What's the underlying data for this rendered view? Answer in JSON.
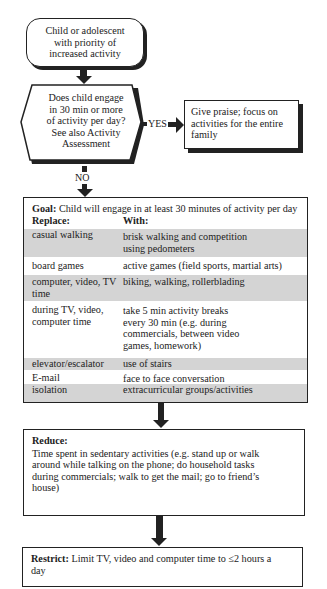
{
  "start": {
    "text": "Child or adolescent with priority of increased activity",
    "lines": [
      "Child or adolescent",
      "with priority of",
      "increased activity"
    ]
  },
  "decision": {
    "lines": [
      "Does child engage",
      "in 30 min or more",
      "of activity per day?",
      "See also Activity",
      "Assessment"
    ]
  },
  "yes_label": "YES",
  "no_label": "NO",
  "praise": {
    "text": "Give praise; focus on activities for the entire family"
  },
  "goal": {
    "label": "Goal:",
    "text": "Child will engage in at least 30 minutes of activity per day",
    "col_replace": "Replace:",
    "col_with": "With:",
    "rows": [
      {
        "replace": "casual walking",
        "with": "brisk walking and competition using pedometers",
        "shaded": true
      },
      {
        "replace": "board games",
        "with": "active games (field sports, martial arts)",
        "shaded": false
      },
      {
        "replace": "computer, video, TV time",
        "with": "biking, walking, rollerblading",
        "shaded": true
      },
      {
        "replace": "during TV, video, computer time",
        "with": "take 5 min activity breaks every 30 min (e.g. during commercials, between video games, homework)",
        "shaded": false
      },
      {
        "replace": "elevator/escalator",
        "with": "use of stairs",
        "shaded": true
      },
      {
        "replace": "E-mail",
        "with": "face to face conversation",
        "shaded": false
      },
      {
        "replace": "isolation",
        "with": "extracurricular groups/activities",
        "shaded": true
      }
    ]
  },
  "reduce": {
    "label": "Reduce:",
    "text": "Time spent in sedentary activities (e.g. stand up or walk around while talking on the phone; do household tasks during commercials; walk to get the mail; go to friend’s house)"
  },
  "restrict": {
    "label": "Restrict:",
    "text": "Limit TV, video and computer time to ≤2 hours a day"
  },
  "colors": {
    "line": "#222222",
    "shade": "#d4d4d4",
    "background": "#ffffff"
  }
}
